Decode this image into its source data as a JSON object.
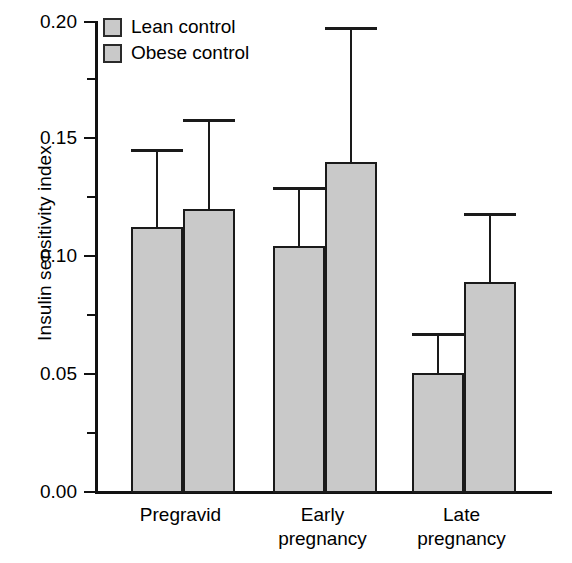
{
  "chart_data": {
    "type": "bar",
    "title": "",
    "xlabel": "",
    "ylabel": "Insulin sensitivity index",
    "categories": [
      "Pregravid",
      "Early\npregnancy",
      "Late\npregnancy"
    ],
    "ylim": [
      0.0,
      0.2
    ],
    "yticks": [
      "0.00",
      "0.05",
      "0.10",
      "0.15",
      "0.20"
    ],
    "ytick_values": [
      0.0,
      0.05,
      0.1,
      0.15,
      0.2
    ],
    "yminor_values": [
      0.025,
      0.075,
      0.125,
      0.175
    ],
    "grid": false,
    "legend_position": "top-left",
    "series": [
      {
        "name": "Lean control",
        "color": "#c9c9c9",
        "values": [
          0.113,
          0.105,
          0.051
        ],
        "errors_upper": [
          0.145,
          0.129,
          0.067
        ]
      },
      {
        "name": "Obese control",
        "color": "#c9c9c9",
        "values": [
          0.121,
          0.141,
          0.09
        ],
        "errors_upper": [
          0.158,
          0.197,
          0.118
        ]
      }
    ]
  },
  "axis": {
    "y_title": "Insulin sensitivity index",
    "tick_0": "0.00",
    "tick_1": "0.05",
    "tick_2": "0.10",
    "tick_3": "0.15",
    "tick_4": "0.20"
  },
  "legend": {
    "item_0": "Lean control",
    "item_1": "Obese control"
  },
  "groups": {
    "g0": "Pregravid",
    "g1": "Early\npregnancy",
    "g2": "Late\npregnancy"
  }
}
